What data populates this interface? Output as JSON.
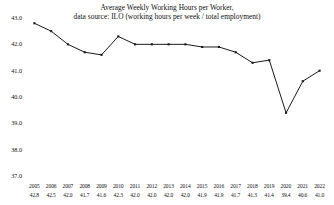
{
  "chart_data": {
    "type": "line",
    "title": "Average Weekly Working Hours per Worker,",
    "subtitle": "data source: ILO (working hours per week / total employment)",
    "xlabel": "",
    "ylabel": "",
    "ylim": [
      37.0,
      43.0
    ],
    "grid": false,
    "legend": "none",
    "line_color": "#1a1a1a",
    "marker": "square",
    "categories": [
      "2005",
      "2006",
      "2007",
      "2008",
      "2009",
      "2010",
      "2011",
      "2012",
      "2013",
      "2014",
      "2015",
      "2016",
      "2017",
      "2018",
      "2019",
      "2020",
      "2021",
      "2022"
    ],
    "values": [
      42.8,
      42.5,
      42.0,
      41.7,
      41.6,
      42.3,
      42.0,
      42.0,
      42.0,
      42.0,
      41.9,
      41.9,
      41.7,
      41.3,
      41.4,
      39.4,
      40.6,
      41.0
    ],
    "ytick_labels": [
      "43.0",
      "42.0",
      "41.0",
      "40.0",
      "39.0",
      "38.0",
      "37.0"
    ],
    "ytick_values": [
      43.0,
      42.0,
      41.0,
      40.0,
      39.0,
      38.0,
      37.0
    ]
  },
  "table": {
    "years": [
      "2005",
      "2006",
      "2007",
      "2008",
      "2009",
      "2010",
      "2011",
      "2012",
      "2013",
      "2014",
      "2015",
      "2016",
      "2017",
      "2018",
      "2019",
      "2020",
      "2021",
      "2022"
    ],
    "values": [
      "42.8",
      "42.5",
      "42.0",
      "41.7",
      "41.6",
      "42.3",
      "42.0",
      "42.0",
      "42.0",
      "42.0",
      "41.9",
      "41.9",
      "41.7",
      "41.3",
      "41.4",
      "39.4",
      "40.6",
      "41.0"
    ]
  }
}
